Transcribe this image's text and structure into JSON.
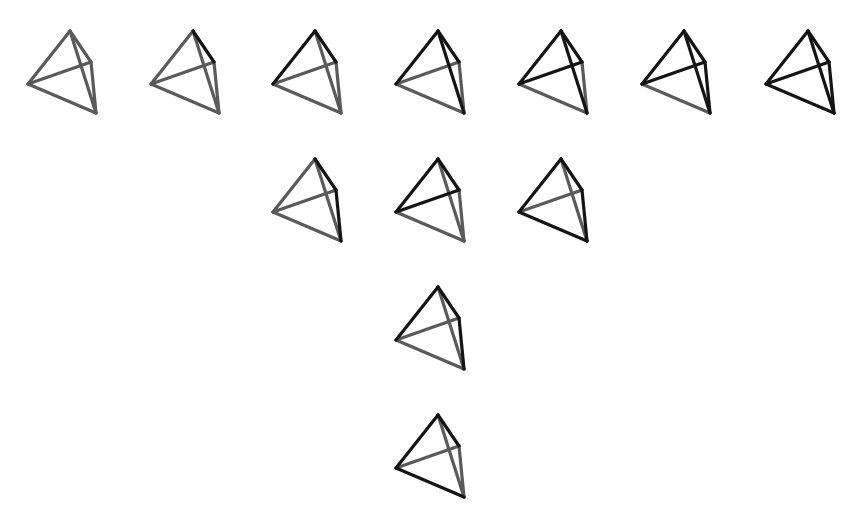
{
  "diagram": {
    "colors": {
      "highlighted": "#141414",
      "normal": "#5a5a5a",
      "background": "#ffffff"
    },
    "vertices": {
      "T": [
        70,
        31
      ],
      "R": [
        91,
        62
      ],
      "L": [
        28,
        84
      ],
      "B": [
        96,
        113
      ]
    },
    "edges": [
      [
        "T",
        "L"
      ],
      [
        "T",
        "R"
      ],
      [
        "T",
        "B"
      ],
      [
        "L",
        "R"
      ],
      [
        "L",
        "B"
      ],
      [
        "R",
        "B"
      ]
    ],
    "tetrahedra": [
      {
        "row": 1,
        "dx": 0,
        "dy": 0,
        "highlighted": []
      },
      {
        "row": 1,
        "dx": 123,
        "dy": 0,
        "highlighted": [
          "T-R"
        ]
      },
      {
        "row": 1,
        "dx": 245,
        "dy": 0,
        "highlighted": [
          "T-L",
          "T-R"
        ]
      },
      {
        "row": 1,
        "dx": 368,
        "dy": 0,
        "highlighted": [
          "T-L",
          "T-R",
          "T-B"
        ]
      },
      {
        "row": 1,
        "dx": 491,
        "dy": 0,
        "highlighted": [
          "T-L",
          "T-R",
          "T-B",
          "L-R"
        ]
      },
      {
        "row": 1,
        "dx": 614,
        "dy": 0,
        "highlighted": [
          "T-L",
          "T-R",
          "T-B",
          "L-R",
          "R-B"
        ]
      },
      {
        "row": 1,
        "dx": 738,
        "dy": 0,
        "highlighted": [
          "T-L",
          "T-R",
          "T-B",
          "L-R",
          "L-B",
          "R-B"
        ]
      },
      {
        "row": 2,
        "dx": 245,
        "dy": 128,
        "highlighted": [
          "T-R",
          "R-B"
        ]
      },
      {
        "row": 2,
        "dx": 368,
        "dy": 128,
        "highlighted": [
          "T-L",
          "T-R",
          "L-R"
        ]
      },
      {
        "row": 2,
        "dx": 491,
        "dy": 128,
        "highlighted": [
          "T-L",
          "T-R",
          "L-B",
          "R-B"
        ]
      },
      {
        "row": 3,
        "dx": 368,
        "dy": 256,
        "highlighted": [
          "T-L",
          "T-R",
          "R-B"
        ]
      },
      {
        "row": 4,
        "dx": 368,
        "dy": 384,
        "highlighted": [
          "T-L",
          "T-R",
          "L-B"
        ]
      }
    ]
  }
}
